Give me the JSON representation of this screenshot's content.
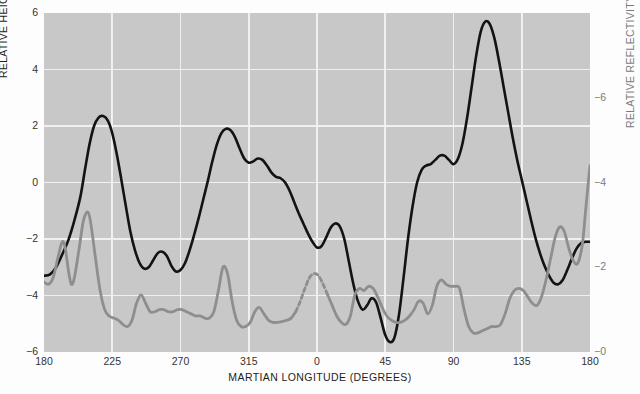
{
  "chart_data": {
    "type": "line",
    "title": "",
    "xlabel": "MARTIAN LONGITUDE (DEGREES)",
    "ylabel_left": "RELATIVE HEIGHT (KILOMETERS)",
    "ylabel_right": "RELATIVE REFLECTIVITY",
    "grid": true,
    "legend_position": "none",
    "xlim": [
      180,
      540
    ],
    "xticks": [
      180,
      225,
      270,
      315,
      0,
      45,
      90,
      135,
      180
    ],
    "xtick_labels": [
      "180",
      "225",
      "270",
      "315",
      "0",
      "45",
      "90",
      "135",
      "180"
    ],
    "ylim_left": [
      -6,
      6
    ],
    "yticks_left": [
      6,
      4,
      2,
      0,
      -2,
      -4,
      -6
    ],
    "ytick_labels_left": [
      "6",
      "4",
      "2",
      "0",
      "−2",
      "−4",
      "−6"
    ],
    "ylim_right": [
      0,
      8
    ],
    "yticks_right": [
      6,
      4,
      2,
      0
    ],
    "ytick_labels_right": [
      "−6",
      "−4",
      "−2",
      "−0"
    ],
    "series": [
      {
        "name": "relative height",
        "axis": "left",
        "color": "#121212",
        "style": "solid",
        "units": "kilometers",
        "points": [
          [
            180,
            -3.3
          ],
          [
            184,
            -3.25
          ],
          [
            188,
            -3.0
          ],
          [
            192,
            -2.55
          ],
          [
            196,
            -2.05
          ],
          [
            200,
            -1.35
          ],
          [
            204,
            -0.5
          ],
          [
            207,
            0.45
          ],
          [
            210,
            1.35
          ],
          [
            213,
            2.0
          ],
          [
            216,
            2.3
          ],
          [
            219,
            2.35
          ],
          [
            222,
            2.2
          ],
          [
            225,
            1.75
          ],
          [
            228,
            1.0
          ],
          [
            231,
            0.1
          ],
          [
            234,
            -0.85
          ],
          [
            237,
            -1.75
          ],
          [
            240,
            -2.4
          ],
          [
            243,
            -2.85
          ],
          [
            246,
            -3.05
          ],
          [
            249,
            -3.0
          ],
          [
            252,
            -2.75
          ],
          [
            255,
            -2.5
          ],
          [
            258,
            -2.45
          ],
          [
            261,
            -2.6
          ],
          [
            264,
            -2.95
          ],
          [
            267,
            -3.15
          ],
          [
            270,
            -3.1
          ],
          [
            273,
            -2.85
          ],
          [
            276,
            -2.4
          ],
          [
            279,
            -1.85
          ],
          [
            282,
            -1.25
          ],
          [
            285,
            -0.6
          ],
          [
            288,
            0.05
          ],
          [
            291,
            0.75
          ],
          [
            294,
            1.35
          ],
          [
            297,
            1.75
          ],
          [
            300,
            1.9
          ],
          [
            303,
            1.85
          ],
          [
            306,
            1.6
          ],
          [
            309,
            1.2
          ],
          [
            312,
            0.85
          ],
          [
            315,
            0.7
          ],
          [
            318,
            0.75
          ],
          [
            321,
            0.85
          ],
          [
            324,
            0.8
          ],
          [
            327,
            0.6
          ],
          [
            330,
            0.35
          ],
          [
            333,
            0.2
          ],
          [
            336,
            0.15
          ],
          [
            339,
            0.0
          ],
          [
            342,
            -0.3
          ],
          [
            345,
            -0.7
          ],
          [
            348,
            -1.1
          ],
          [
            351,
            -1.45
          ],
          [
            354,
            -1.8
          ],
          [
            357,
            -2.1
          ],
          [
            360,
            -2.3
          ],
          [
            363,
            -2.25
          ],
          [
            366,
            -1.95
          ],
          [
            369,
            -1.6
          ],
          [
            372,
            -1.45
          ],
          [
            375,
            -1.55
          ],
          [
            378,
            -2.0
          ],
          [
            381,
            -2.8
          ],
          [
            384,
            -3.6
          ],
          [
            387,
            -4.2
          ],
          [
            390,
            -4.5
          ],
          [
            393,
            -4.35
          ],
          [
            396,
            -4.1
          ],
          [
            399,
            -4.25
          ],
          [
            402,
            -4.8
          ],
          [
            405,
            -5.4
          ],
          [
            408,
            -5.65
          ],
          [
            411,
            -5.5
          ],
          [
            414,
            -4.7
          ],
          [
            417,
            -3.4
          ],
          [
            420,
            -2.0
          ],
          [
            423,
            -0.85
          ],
          [
            426,
            0.0
          ],
          [
            429,
            0.45
          ],
          [
            432,
            0.6
          ],
          [
            435,
            0.65
          ],
          [
            438,
            0.8
          ],
          [
            441,
            0.95
          ],
          [
            444,
            0.95
          ],
          [
            447,
            0.8
          ],
          [
            450,
            0.65
          ],
          [
            453,
            0.85
          ],
          [
            456,
            1.4
          ],
          [
            459,
            2.3
          ],
          [
            462,
            3.4
          ],
          [
            465,
            4.5
          ],
          [
            468,
            5.35
          ],
          [
            471,
            5.7
          ],
          [
            474,
            5.6
          ],
          [
            477,
            5.1
          ],
          [
            480,
            4.3
          ],
          [
            483,
            3.4
          ],
          [
            486,
            2.5
          ],
          [
            489,
            1.6
          ],
          [
            492,
            0.8
          ],
          [
            495,
            0.1
          ],
          [
            498,
            -0.6
          ],
          [
            501,
            -1.3
          ],
          [
            504,
            -1.95
          ],
          [
            507,
            -2.5
          ],
          [
            510,
            -2.95
          ],
          [
            513,
            -3.3
          ],
          [
            516,
            -3.55
          ],
          [
            519,
            -3.6
          ],
          [
            522,
            -3.45
          ],
          [
            525,
            -3.1
          ],
          [
            528,
            -2.7
          ],
          [
            531,
            -2.35
          ],
          [
            534,
            -2.15
          ],
          [
            537,
            -2.1
          ],
          [
            540,
            -2.1
          ]
        ]
      },
      {
        "name": "relative reflectivity",
        "axis": "right",
        "color": "#8f8f8f",
        "style": "solid-with-dashed-gap",
        "dashed_range": [
          345,
          366
        ],
        "points": [
          [
            180,
            1.65
          ],
          [
            183,
            1.6
          ],
          [
            186,
            1.75
          ],
          [
            189,
            2.2
          ],
          [
            192,
            2.6
          ],
          [
            194,
            2.45
          ],
          [
            196,
            1.95
          ],
          [
            198,
            1.6
          ],
          [
            200,
            1.75
          ],
          [
            203,
            2.4
          ],
          [
            206,
            3.1
          ],
          [
            209,
            3.3
          ],
          [
            211,
            3.0
          ],
          [
            214,
            2.2
          ],
          [
            217,
            1.45
          ],
          [
            220,
            1.0
          ],
          [
            223,
            0.85
          ],
          [
            226,
            0.8
          ],
          [
            229,
            0.75
          ],
          [
            232,
            0.65
          ],
          [
            235,
            0.6
          ],
          [
            238,
            0.75
          ],
          [
            241,
            1.15
          ],
          [
            244,
            1.35
          ],
          [
            247,
            1.15
          ],
          [
            250,
            0.95
          ],
          [
            253,
            0.95
          ],
          [
            256,
            1.0
          ],
          [
            259,
            1.0
          ],
          [
            262,
            0.95
          ],
          [
            265,
            0.95
          ],
          [
            268,
            1.0
          ],
          [
            271,
            1.0
          ],
          [
            274,
            0.95
          ],
          [
            277,
            0.9
          ],
          [
            280,
            0.85
          ],
          [
            283,
            0.85
          ],
          [
            286,
            0.8
          ],
          [
            289,
            0.8
          ],
          [
            292,
            0.95
          ],
          [
            295,
            1.45
          ],
          [
            298,
            2.0
          ],
          [
            301,
            1.85
          ],
          [
            304,
            1.2
          ],
          [
            307,
            0.75
          ],
          [
            310,
            0.6
          ],
          [
            313,
            0.6
          ],
          [
            316,
            0.7
          ],
          [
            319,
            0.95
          ],
          [
            322,
            1.05
          ],
          [
            325,
            0.9
          ],
          [
            328,
            0.75
          ],
          [
            331,
            0.7
          ],
          [
            334,
            0.7
          ],
          [
            337,
            0.72
          ],
          [
            340,
            0.75
          ],
          [
            343,
            0.8
          ],
          [
            346,
            0.95
          ],
          [
            349,
            1.2
          ],
          [
            352,
            1.5
          ],
          [
            355,
            1.75
          ],
          [
            358,
            1.85
          ],
          [
            361,
            1.8
          ],
          [
            364,
            1.6
          ],
          [
            367,
            1.35
          ],
          [
            370,
            1.1
          ],
          [
            373,
            0.85
          ],
          [
            376,
            0.7
          ],
          [
            379,
            0.65
          ],
          [
            382,
            0.85
          ],
          [
            385,
            1.35
          ],
          [
            388,
            1.5
          ],
          [
            391,
            1.45
          ],
          [
            394,
            1.55
          ],
          [
            397,
            1.5
          ],
          [
            400,
            1.3
          ],
          [
            403,
            1.05
          ],
          [
            406,
            0.85
          ],
          [
            409,
            0.75
          ],
          [
            412,
            0.7
          ],
          [
            415,
            0.7
          ],
          [
            418,
            0.75
          ],
          [
            421,
            0.85
          ],
          [
            424,
            1.0
          ],
          [
            427,
            1.2
          ],
          [
            430,
            1.15
          ],
          [
            433,
            0.9
          ],
          [
            436,
            1.1
          ],
          [
            439,
            1.55
          ],
          [
            442,
            1.7
          ],
          [
            445,
            1.6
          ],
          [
            448,
            1.55
          ],
          [
            451,
            1.55
          ],
          [
            454,
            1.5
          ],
          [
            457,
            1.0
          ],
          [
            460,
            0.6
          ],
          [
            463,
            0.45
          ],
          [
            466,
            0.45
          ],
          [
            469,
            0.5
          ],
          [
            472,
            0.55
          ],
          [
            475,
            0.6
          ],
          [
            478,
            0.6
          ],
          [
            481,
            0.65
          ],
          [
            484,
            0.9
          ],
          [
            487,
            1.25
          ],
          [
            490,
            1.45
          ],
          [
            493,
            1.5
          ],
          [
            496,
            1.45
          ],
          [
            499,
            1.3
          ],
          [
            502,
            1.15
          ],
          [
            505,
            1.1
          ],
          [
            508,
            1.3
          ],
          [
            511,
            1.7
          ],
          [
            514,
            2.2
          ],
          [
            517,
            2.7
          ],
          [
            520,
            2.95
          ],
          [
            523,
            2.85
          ],
          [
            526,
            2.45
          ],
          [
            529,
            2.15
          ],
          [
            532,
            2.1
          ],
          [
            535,
            2.55
          ],
          [
            537,
            3.3
          ],
          [
            539,
            4.05
          ],
          [
            540,
            4.4
          ]
        ]
      }
    ]
  },
  "colors": {
    "plot_background": "#c9c9c9",
    "gridline": "#f2f2f2",
    "height_series": "#121212",
    "reflectivity_series": "#8f8f8f",
    "page_background": "#fdfdfd"
  }
}
